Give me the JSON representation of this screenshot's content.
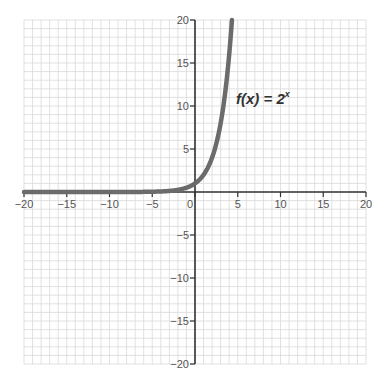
{
  "chart_data": {
    "type": "line",
    "title": "",
    "xlabel": "",
    "ylabel": "",
    "xlim": [
      -20,
      20
    ],
    "ylim": [
      -20,
      20
    ],
    "grid": true,
    "grid_step": 1,
    "x_ticks": [
      -20,
      -15,
      -10,
      -5,
      0,
      5,
      10,
      15,
      20
    ],
    "y_ticks": [
      -20,
      -15,
      -10,
      -5,
      5,
      10,
      15,
      20
    ],
    "x_tick_labels": [
      "−20",
      "−15",
      "−10",
      "−5",
      "0",
      "5",
      "10",
      "15",
      "20"
    ],
    "y_tick_labels": [
      "−20",
      "−15",
      "−10",
      "−5",
      "5",
      "10",
      "15",
      "20"
    ],
    "series": [
      {
        "name": "f(x) = 2^x",
        "function": "2^x",
        "x": [
          -20,
          -10,
          -5,
          -4,
          -3,
          -2,
          -1,
          0,
          1,
          2,
          3,
          4,
          4.32
        ],
        "values": [
          1e-06,
          0.001,
          0.03125,
          0.0625,
          0.125,
          0.25,
          0.5,
          1,
          2,
          4,
          8,
          16,
          20
        ],
        "color": "#6b6b6b"
      }
    ],
    "annotations": [
      {
        "text_main": "f(x) = 2",
        "text_sup": "x",
        "x": 4.8,
        "y": 10.2
      }
    ]
  },
  "colors": {
    "grid": "#d9d9d9",
    "axis": "#333333",
    "curve": "#6b6b6b"
  }
}
